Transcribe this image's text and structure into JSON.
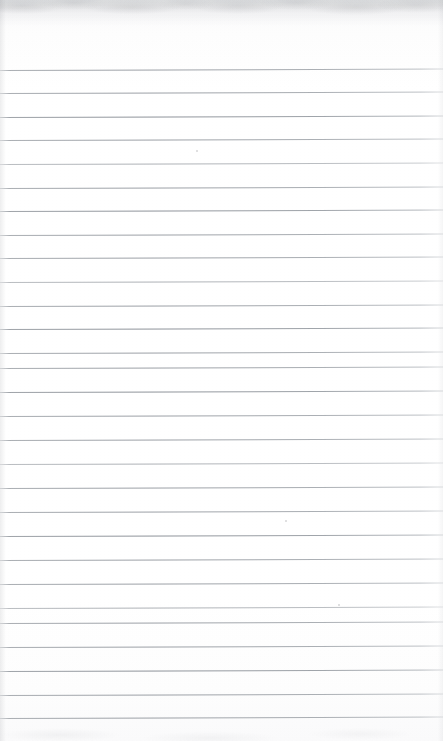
{
  "document": {
    "kind": "scanned-ruled-notepad-page",
    "page_width": 443,
    "page_height": 741,
    "orientation": "portrait",
    "content_text": "",
    "has_handwriting": false,
    "has_printed_text": false,
    "is_blank": true
  },
  "paper": {
    "background_color": "#ffffff",
    "tone_description": "near-white scanned paper",
    "top_shadow_color": "#929599",
    "bottom_shadow_color": "#a0a2a6",
    "edge_shadow_color": "#969299"
  },
  "ruling": {
    "style": "horizontal-ruled",
    "line_color": "#8c9198",
    "line_color_light": "#b2b6bb",
    "line_thickness_px": 1,
    "line_count": 28,
    "first_line_y": 70,
    "last_line_y": 718,
    "spacing_px": 24,
    "left_inset_px": 0,
    "right_inset_px": 0,
    "skew_deg": -0.18,
    "has_vertical_margin_rule": false,
    "header_blank_height_px": 70,
    "footer_blank_height_px": 23,
    "lines": [
      {
        "index": 1,
        "y": 70,
        "weight": "normal"
      },
      {
        "index": 2,
        "y": 93,
        "weight": "normal"
      },
      {
        "index": 3,
        "y": 117,
        "weight": "strong"
      },
      {
        "index": 4,
        "y": 140,
        "weight": "normal"
      },
      {
        "index": 5,
        "y": 164,
        "weight": "faint"
      },
      {
        "index": 6,
        "y": 188,
        "weight": "normal"
      },
      {
        "index": 7,
        "y": 211,
        "weight": "strong"
      },
      {
        "index": 8,
        "y": 235,
        "weight": "normal"
      },
      {
        "index": 9,
        "y": 258,
        "weight": "normal"
      },
      {
        "index": 10,
        "y": 282,
        "weight": "faint"
      },
      {
        "index": 11,
        "y": 306,
        "weight": "normal"
      },
      {
        "index": 12,
        "y": 329,
        "weight": "strong"
      },
      {
        "index": 13,
        "y": 353,
        "weight": "normal"
      },
      {
        "index": 14,
        "y": 368,
        "weight": "normal"
      },
      {
        "index": 15,
        "y": 392,
        "weight": "strong"
      },
      {
        "index": 16,
        "y": 416,
        "weight": "normal"
      },
      {
        "index": 17,
        "y": 440,
        "weight": "normal"
      },
      {
        "index": 18,
        "y": 464,
        "weight": "faint"
      },
      {
        "index": 19,
        "y": 488,
        "weight": "normal"
      },
      {
        "index": 20,
        "y": 512,
        "weight": "normal"
      },
      {
        "index": 21,
        "y": 536,
        "weight": "strong"
      },
      {
        "index": 22,
        "y": 560,
        "weight": "normal"
      },
      {
        "index": 23,
        "y": 584,
        "weight": "normal"
      },
      {
        "index": 24,
        "y": 608,
        "weight": "faint"
      },
      {
        "index": 25,
        "y": 623,
        "weight": "normal"
      },
      {
        "index": 26,
        "y": 647,
        "weight": "normal"
      },
      {
        "index": 27,
        "y": 671,
        "weight": "strong"
      },
      {
        "index": 28,
        "y": 695,
        "weight": "normal"
      },
      {
        "index": 29,
        "y": 718,
        "weight": "normal"
      }
    ]
  },
  "artifacts": {
    "specks": [
      {
        "x": 285,
        "y": 520
      },
      {
        "x": 196,
        "y": 150
      },
      {
        "x": 338,
        "y": 604
      }
    ]
  }
}
